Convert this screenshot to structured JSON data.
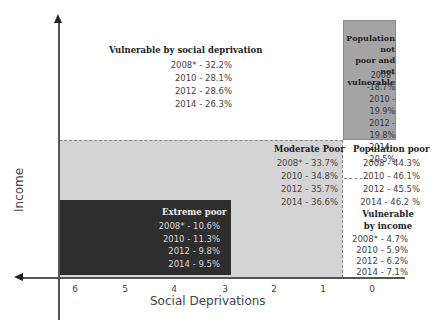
{
  "axes": {
    "x_label": "Social Deprivations",
    "y_label": "Income",
    "x_ticks": [
      "6",
      "5",
      "4",
      "3",
      "2",
      "1",
      "0"
    ]
  },
  "regions": {
    "vulnerable_social": {
      "title": "Vulnerable by social deprivation",
      "values": [
        "2008* - 32.2%",
        "2010 - 28.1%",
        "2012 - 28.6%",
        "2014 - 26.3%"
      ]
    },
    "not_poor": {
      "title_lines": [
        "Population not",
        "poor and not",
        "vulnerable"
      ],
      "values": [
        "2008* -18.7%",
        "2010 - 19.9%",
        "2012 - 19.8%",
        "2014 - 20.5%"
      ],
      "color": "#a5a5a5"
    },
    "moderate_poor": {
      "title": "Moderate Poor",
      "values": [
        "2008* - 33.7%",
        "2010 - 34.8%",
        "2012 - 35.7%",
        "2014 - 36.6%"
      ],
      "color": "#d4d4d4"
    },
    "population_poor": {
      "title": "Population poor",
      "values": [
        "2008 - 44.3%",
        "2010 - 46.1%",
        "2012 - 45.5%",
        "2014 - 46.2 %"
      ]
    },
    "vulnerable_income": {
      "title_lines": [
        "Vulnerable",
        "by income"
      ],
      "values": [
        "2008* - 4.7%",
        "2010 - 5.9%",
        "2012 - 6.2%",
        "2014 - 7.1%"
      ]
    },
    "extreme_poor": {
      "title": "Extreme poor",
      "values": [
        "2008* - 10.6%",
        "2010 - 11.3%",
        "2012 - 9.8%",
        "2014 - 9.5%"
      ],
      "color": "#2e2e2e"
    }
  }
}
